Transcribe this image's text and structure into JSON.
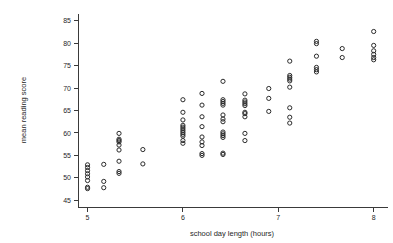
{
  "figure": {
    "type": "scatter-plot",
    "background_color": "#ffffff",
    "marker_color": "#2b2b2b",
    "axis_color": "#3a3a3a"
  },
  "axes": {
    "x_title": "school day length (hours)",
    "y_title": "mean reading score",
    "x_ticks": [
      "5",
      "6",
      "7",
      "8"
    ],
    "y_ticks": [
      "45",
      "50",
      "55",
      "60",
      "65",
      "70",
      "75",
      "80",
      "85"
    ]
  },
  "chart_data": {
    "type": "scatter",
    "title": "",
    "xlabel": "school day length (hours)",
    "ylabel": "mean reading score",
    "xlim": [
      4.9,
      8.15
    ],
    "ylim": [
      43.5,
      86.5
    ],
    "xticks": [
      5,
      6,
      7,
      8
    ],
    "yticks": [
      45,
      50,
      55,
      60,
      65,
      70,
      75,
      80,
      85
    ],
    "grid": false,
    "legend": null,
    "marker": "open-circle",
    "points": [
      [
        5.0,
        47.6
      ],
      [
        5.0,
        47.9
      ],
      [
        5.0,
        49.4
      ],
      [
        5.0,
        50.2
      ],
      [
        5.0,
        50.9
      ],
      [
        5.0,
        51.6
      ],
      [
        5.0,
        52.3
      ],
      [
        5.0,
        52.9
      ],
      [
        5.17,
        47.8
      ],
      [
        5.17,
        49.2
      ],
      [
        5.17,
        53.0
      ],
      [
        5.33,
        51.0
      ],
      [
        5.33,
        51.4
      ],
      [
        5.33,
        53.7
      ],
      [
        5.33,
        56.2
      ],
      [
        5.33,
        57.3
      ],
      [
        5.33,
        58.0
      ],
      [
        5.33,
        58.3
      ],
      [
        5.33,
        58.6
      ],
      [
        5.33,
        59.9
      ],
      [
        5.58,
        53.1
      ],
      [
        5.58,
        56.3
      ],
      [
        6.0,
        57.7
      ],
      [
        6.0,
        58.3
      ],
      [
        6.0,
        59.3
      ],
      [
        6.0,
        59.7
      ],
      [
        6.0,
        60.1
      ],
      [
        6.0,
        60.5
      ],
      [
        6.0,
        60.9
      ],
      [
        6.0,
        61.3
      ],
      [
        6.0,
        61.7
      ],
      [
        6.0,
        62.9
      ],
      [
        6.0,
        64.6
      ],
      [
        6.0,
        67.4
      ],
      [
        6.2,
        55.0
      ],
      [
        6.2,
        55.4
      ],
      [
        6.2,
        57.2
      ],
      [
        6.2,
        58.0
      ],
      [
        6.2,
        59.1
      ],
      [
        6.2,
        61.4
      ],
      [
        6.2,
        63.6
      ],
      [
        6.2,
        66.2
      ],
      [
        6.2,
        68.8
      ],
      [
        6.42,
        55.2
      ],
      [
        6.42,
        55.5
      ],
      [
        6.42,
        59.0
      ],
      [
        6.42,
        59.4
      ],
      [
        6.42,
        59.8
      ],
      [
        6.42,
        60.2
      ],
      [
        6.42,
        62.5
      ],
      [
        6.42,
        63.1
      ],
      [
        6.42,
        64.0
      ],
      [
        6.42,
        66.2
      ],
      [
        6.42,
        66.6
      ],
      [
        6.42,
        67.0
      ],
      [
        6.42,
        67.4
      ],
      [
        6.42,
        71.5
      ],
      [
        6.65,
        58.3
      ],
      [
        6.65,
        59.9
      ],
      [
        6.65,
        63.6
      ],
      [
        6.65,
        64.3
      ],
      [
        6.65,
        64.6
      ],
      [
        6.65,
        66.1
      ],
      [
        6.65,
        66.5
      ],
      [
        6.65,
        66.9
      ],
      [
        6.65,
        67.3
      ],
      [
        6.65,
        68.7
      ],
      [
        6.9,
        64.8
      ],
      [
        6.9,
        67.7
      ],
      [
        6.9,
        69.9
      ],
      [
        7.12,
        62.2
      ],
      [
        7.12,
        63.5
      ],
      [
        7.12,
        65.6
      ],
      [
        7.12,
        70.2
      ],
      [
        7.12,
        71.6
      ],
      [
        7.12,
        72.0
      ],
      [
        7.12,
        72.4
      ],
      [
        7.12,
        72.8
      ],
      [
        7.12,
        76.0
      ],
      [
        7.4,
        73.6
      ],
      [
        7.4,
        74.1
      ],
      [
        7.4,
        74.6
      ],
      [
        7.4,
        77.1
      ],
      [
        7.4,
        79.9
      ],
      [
        7.4,
        80.4
      ],
      [
        7.67,
        76.8
      ],
      [
        7.67,
        78.8
      ],
      [
        8.0,
        76.3
      ],
      [
        8.0,
        76.8
      ],
      [
        8.0,
        77.5
      ],
      [
        8.0,
        78.3
      ],
      [
        8.0,
        79.5
      ],
      [
        8.0,
        82.6
      ]
    ]
  }
}
